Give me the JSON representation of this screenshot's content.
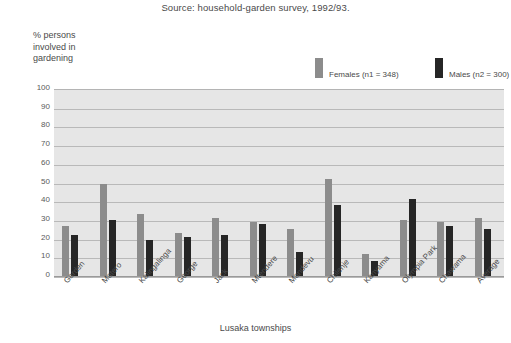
{
  "source_note": "Source: household-garden survey, 1992/93.",
  "y_axis_caption_lines": [
    "% persons",
    "involved in",
    "gardening"
  ],
  "legend": {
    "females_label": "Females (n1 = 348)",
    "males_label": "Males  (n2 = 300)",
    "females_color": "#8c8c8c",
    "males_color": "#262626"
  },
  "chart_data": {
    "type": "bar",
    "title": "",
    "subtitle": "Source: household-garden survey, 1992/93.",
    "xlabel": "Lusaka townships",
    "ylabel": "% persons involved in gardening",
    "ylim": [
      0,
      100
    ],
    "yticks": [
      0,
      10,
      20,
      30,
      40,
      50,
      60,
      70,
      80,
      90,
      100
    ],
    "ytick_labels": [
      "0",
      "10",
      "20",
      "30",
      "40",
      "50",
      "60",
      "70",
      "80",
      "90",
      "100"
    ],
    "grid": true,
    "legend_position": "top-right",
    "categories": [
      "Garden",
      "Matero",
      "Kalingalinga",
      "George",
      "Jack",
      "Mtendere",
      "Mandevu",
      "Chilenje",
      "Kanyama",
      "Olympia Park",
      "Chawama",
      "Average"
    ],
    "series": [
      {
        "name": "Females (n1 = 348)",
        "color": "#8c8c8c",
        "values": [
          27,
          49,
          33,
          23,
          31,
          29,
          25,
          52,
          12,
          30,
          29,
          31
        ]
      },
      {
        "name": "Males  (n2 = 300)",
        "color": "#262626",
        "values": [
          22,
          30,
          19,
          21,
          22,
          28,
          13,
          38,
          8,
          41,
          27,
          25
        ]
      }
    ]
  }
}
